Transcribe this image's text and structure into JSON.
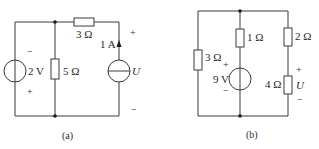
{
  "figure_a": {
    "caption": "(a)",
    "voltage_source": {
      "label": "2 V",
      "top_polarity": "−",
      "bottom_polarity": "+"
    },
    "resistor_shunt": {
      "label": "5 Ω"
    },
    "resistor_series": {
      "label": "3 Ω"
    },
    "current_source": {
      "label": "1 A",
      "direction": "up"
    },
    "output": {
      "label": "U",
      "top_polarity": "+",
      "bottom_polarity": "−"
    }
  },
  "figure_b": {
    "caption": "(b)",
    "resistor_left": {
      "label": "3 Ω"
    },
    "resistor_mid": {
      "label": "1 Ω"
    },
    "voltage_source": {
      "label": "9 V",
      "top_polarity": "+",
      "bottom_polarity": "−"
    },
    "resistor_right_top": {
      "label": "2 Ω"
    },
    "resistor_right_bottom": {
      "label": "4 Ω"
    },
    "output": {
      "label": "U",
      "top_polarity": "+",
      "bottom_polarity": "−"
    }
  }
}
